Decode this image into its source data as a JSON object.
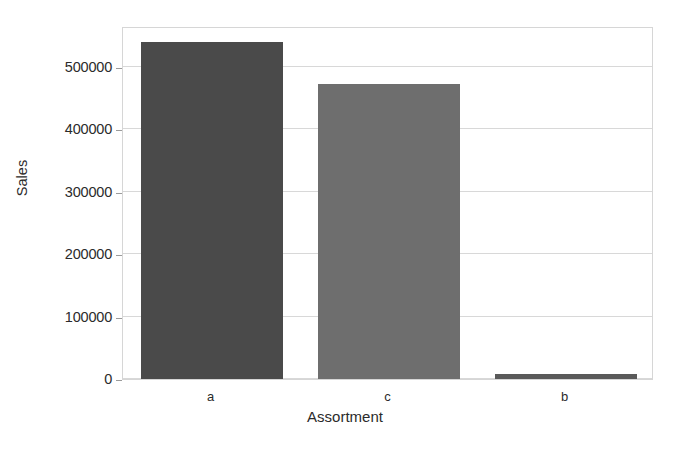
{
  "chart_data": {
    "type": "bar",
    "title": "",
    "xlabel": "Assortment",
    "ylabel": "Sales",
    "categories": [
      "a",
      "c",
      "b"
    ],
    "values": [
      540000,
      472000,
      8000
    ],
    "series": [
      {
        "name": "Sales",
        "values": [
          540000,
          472000,
          8000
        ]
      }
    ],
    "bar_colors": [
      "#4a4a4a",
      "#6e6e6e",
      "#5a5a5a"
    ],
    "ylim": [
      0,
      565000
    ],
    "xlim_categories": 3,
    "yticks": [
      0,
      100000,
      200000,
      300000,
      400000,
      500000
    ],
    "ytick_labels": [
      "0",
      "100000",
      "200000",
      "300000",
      "400000",
      "500000"
    ],
    "xtick_labels": [
      "a",
      "c",
      "b"
    ],
    "grid": true,
    "grid_axis": "y",
    "grid_color": "#d8d8d8",
    "legend": false,
    "legend_position": "none",
    "frame": true,
    "frame_color": "#d6d6d6",
    "background": "#ffffff",
    "annotations": []
  },
  "axis": {
    "y_title": "Sales",
    "x_title": "Assortment"
  },
  "ticks": {
    "y": [
      {
        "label": "500000",
        "value": 500000
      },
      {
        "label": "400000",
        "value": 400000
      },
      {
        "label": "300000",
        "value": 300000
      },
      {
        "label": "200000",
        "value": 200000
      },
      {
        "label": "100000",
        "value": 100000
      },
      {
        "label": "0",
        "value": 0
      }
    ],
    "x": [
      {
        "label": "a"
      },
      {
        "label": "c"
      },
      {
        "label": "b"
      }
    ]
  }
}
